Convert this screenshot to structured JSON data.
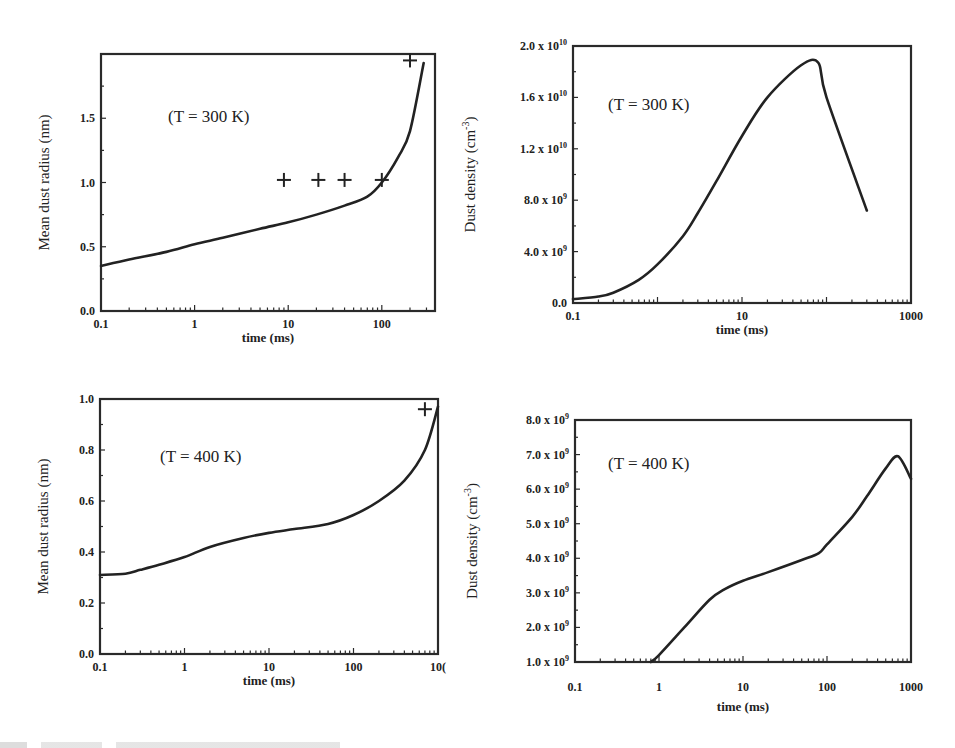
{
  "figure": {
    "bottom_text_sliver": ""
  },
  "chart_data": [
    {
      "id": "radius300",
      "type": "line",
      "title": "",
      "annotation": "(T = 300 K)",
      "xlabel": "time (ms)",
      "ylabel": "Mean dust radius (nm)",
      "xscale": "log",
      "xlim": [
        0.1,
        370
      ],
      "ylim": [
        0.0,
        2.0
      ],
      "xticks": [
        0.1,
        1,
        10,
        100
      ],
      "xtick_labels": [
        "0.1",
        "1",
        "10",
        "100"
      ],
      "yticks": [
        0.0,
        0.5,
        1.0,
        1.5
      ],
      "ytick_labels": [
        "0.0",
        "0.5",
        "1.0",
        "1.5"
      ],
      "grid": false,
      "frame_px": {
        "left": 101,
        "right": 435,
        "top": 54,
        "bottom": 311
      },
      "annotation_px": {
        "x": 168,
        "y": 122
      },
      "series": [
        {
          "name": "model",
          "style": "line",
          "x": [
            0.1,
            0.2,
            0.5,
            1,
            2,
            5,
            10,
            20,
            40,
            70,
            100,
            150,
            200,
            280
          ],
          "y": [
            0.35,
            0.4,
            0.46,
            0.52,
            0.57,
            0.64,
            0.69,
            0.75,
            0.82,
            0.89,
            1.0,
            1.2,
            1.4,
            1.93
          ]
        },
        {
          "name": "experiment",
          "style": "plus",
          "x": [
            9,
            21,
            40,
            100,
            200
          ],
          "y": [
            1.02,
            1.02,
            1.02,
            1.02,
            1.95
          ]
        }
      ]
    },
    {
      "id": "density300",
      "type": "line",
      "title": "",
      "annotation": "(T = 300 K)",
      "xlabel": "time (ms)",
      "ylabel": "Dust density (cm",
      "ylabel_sup": "-3",
      "ylabel_close": ")",
      "xscale": "log",
      "xlim": [
        0.1,
        1000
      ],
      "ylim": [
        0,
        20000000000.0
      ],
      "xticks": [
        0.1,
        10,
        1000
      ],
      "xtick_labels": [
        "0.1",
        "10",
        "1000"
      ],
      "yticks": [
        0,
        4000000000.0,
        8000000000.0,
        12000000000.0,
        16000000000.0,
        20000000000.0
      ],
      "ytick_labels": [
        "0.0",
        "4.0 x 10",
        "8.0 x 10",
        "1.2 x 10",
        "1.6 x 10",
        "2.0 x 10"
      ],
      "ytick_sups": [
        "",
        "9",
        "9",
        "10",
        "10",
        "10"
      ],
      "grid": false,
      "frame_px": {
        "left": 573,
        "right": 911,
        "top": 46,
        "bottom": 303
      },
      "annotation_px": {
        "x": 608,
        "y": 110
      },
      "series": [
        {
          "name": "model",
          "style": "line",
          "x": [
            0.1,
            0.2,
            0.3,
            0.6,
            1,
            2,
            3,
            5,
            10,
            20,
            50,
            80,
            100,
            300
          ],
          "y": [
            300000000.0,
            500000000.0,
            800000000.0,
            1800000000.0,
            3000000000.0,
            5200000000.0,
            7000000000.0,
            9500000000.0,
            13000000000.0,
            16000000000.0,
            18500000000.0,
            18700000000.0,
            16000000000.0,
            7200000000.0
          ]
        }
      ]
    },
    {
      "id": "radius400",
      "type": "line",
      "title": "",
      "annotation": "(T = 400 K)",
      "xlabel": "time (ms)",
      "ylabel": "Mean dust radius (nm)",
      "xscale": "log",
      "xlim": [
        0.1,
        1000
      ],
      "ylim": [
        0.0,
        1.0
      ],
      "xticks": [
        0.1,
        1,
        10,
        100,
        1000
      ],
      "xtick_labels": [
        "0.1",
        "1",
        "10",
        "100",
        "10("
      ],
      "yticks": [
        0.0,
        0.2,
        0.4,
        0.6,
        0.8,
        1.0
      ],
      "ytick_labels": [
        "0.0",
        "0.2",
        "0.4",
        "0.6",
        "0.8",
        "1.0"
      ],
      "grid": false,
      "frame_px": {
        "left": 100,
        "right": 438,
        "top": 399,
        "bottom": 654
      },
      "annotation_px": {
        "x": 160,
        "y": 462
      },
      "series": [
        {
          "name": "model",
          "style": "line",
          "x": [
            0.1,
            0.2,
            0.3,
            0.5,
            1,
            2,
            5,
            10,
            20,
            50,
            100,
            200,
            400,
            700,
            1000
          ],
          "y": [
            0.31,
            0.315,
            0.33,
            0.35,
            0.38,
            0.42,
            0.455,
            0.475,
            0.49,
            0.51,
            0.545,
            0.6,
            0.68,
            0.8,
            0.97
          ]
        },
        {
          "name": "experiment",
          "style": "plus",
          "x": [
            700
          ],
          "y": [
            0.96
          ]
        }
      ]
    },
    {
      "id": "density400",
      "type": "line",
      "title": "",
      "annotation": "(T = 400 K)",
      "xlabel": "time (ms)",
      "ylabel": "Dust density (cm",
      "ylabel_sup": "-3",
      "ylabel_close": ")",
      "xscale": "log",
      "xlim": [
        0.1,
        1000
      ],
      "ylim": [
        1000000000.0,
        8000000000.0
      ],
      "xticks": [
        0.1,
        1,
        10,
        100,
        1000
      ],
      "xtick_labels": [
        "0.1",
        "1",
        "10",
        "100",
        "1000"
      ],
      "yticks": [
        1000000000.0,
        2000000000.0,
        3000000000.0,
        4000000000.0,
        5000000000.0,
        6000000000.0,
        7000000000.0,
        8000000000.0
      ],
      "ytick_labels": [
        "1.0 x 10",
        "2.0 x 10",
        "3.0 x 10",
        "4.0 x 10",
        "5.0 x 10",
        "6.0 x 10",
        "7.0 x 10",
        "8.0 x 10"
      ],
      "ytick_sups": [
        "9",
        "9",
        "9",
        "9",
        "9",
        "9",
        "9",
        "9"
      ],
      "grid": false,
      "frame_px": {
        "left": 575,
        "right": 911,
        "top": 420,
        "bottom": 662
      },
      "annotation_px": {
        "x": 608,
        "y": 469
      },
      "xtick_label_y": 691,
      "xlabel_y": 711,
      "series": [
        {
          "name": "model",
          "style": "line",
          "x": [
            0.8,
            1,
            2,
            4,
            6,
            10,
            20,
            50,
            80,
            100,
            200,
            300,
            500,
            700,
            1000
          ],
          "y": [
            1000000000.0,
            1200000000.0,
            2000000000.0,
            2800000000.0,
            3100000000.0,
            3350000000.0,
            3600000000.0,
            3950000000.0,
            4150000000.0,
            4400000000.0,
            5200000000.0,
            5800000000.0,
            6600000000.0,
            6950000000.0,
            6300000000.0
          ]
        }
      ]
    }
  ]
}
